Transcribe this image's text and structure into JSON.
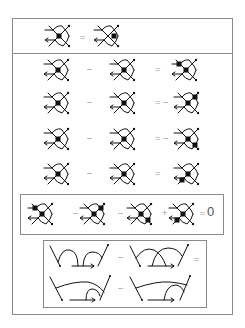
{
  "figure": {
    "colors": {
      "ink": "#111111",
      "frame": "#8a8a8a",
      "operator": "#9a9a9a"
    }
  },
  "top_relation": {
    "lhs": {
      "vertex": "center"
    },
    "op": "=",
    "rhs": {
      "vertex": "right"
    }
  },
  "relations": [
    {
      "a": {
        "vertex": "center"
      },
      "op1": "–",
      "b": {
        "vertex": "right"
      },
      "op2": "=",
      "prefix": "",
      "c": {
        "vertices": [
          "upper-left",
          "center"
        ]
      }
    },
    {
      "a": {
        "vertex": "center"
      },
      "op1": "–",
      "b": {
        "vertex": "right"
      },
      "op2": "=",
      "prefix": "–",
      "c": {
        "vertices": [
          "center",
          "upper-right"
        ]
      }
    },
    {
      "a": {
        "vertex": "center"
      },
      "op1": "–",
      "b": {
        "vertex": "right"
      },
      "op2": "=",
      "prefix": "–",
      "c": {
        "vertices": [
          "center",
          "lower-right"
        ]
      }
    },
    {
      "a": {
        "vertex": "center"
      },
      "op1": "–",
      "b": {
        "vertex": "right"
      },
      "op2": "=",
      "prefix": "",
      "c": {
        "vertices": [
          "center",
          "lower-left"
        ]
      }
    }
  ],
  "four_term": {
    "terms": [
      {
        "sign": "",
        "vertices": [
          "upper-left",
          "center"
        ]
      },
      {
        "sign": "–",
        "vertices": [
          "center",
          "upper-right"
        ]
      },
      {
        "sign": "–",
        "vertices": [
          "center",
          "lower-right"
        ]
      },
      {
        "sign": "+",
        "vertices": [
          "center",
          "lower-left"
        ]
      }
    ],
    "equals": "=",
    "rhs": "0"
  },
  "chord_relation": {
    "row1": {
      "op1": "–",
      "op2": "="
    },
    "row2": {
      "op1": "–"
    }
  }
}
